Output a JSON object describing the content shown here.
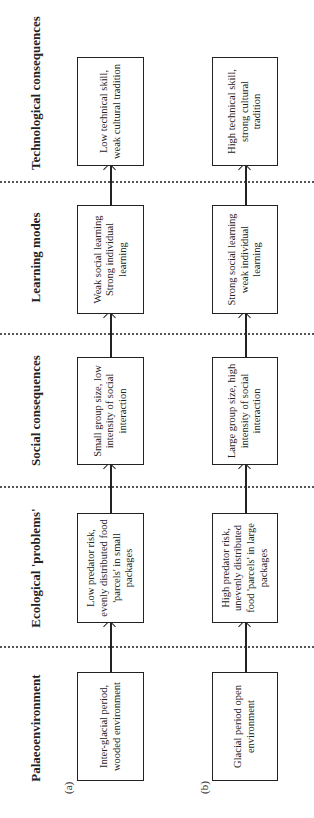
{
  "headers": [
    "Palaeoenvironment",
    "Ecological 'problems'",
    "Social consequences",
    "Learning modes",
    "Technological consequences"
  ],
  "rows": [
    {
      "label": "(a)",
      "boxes": [
        "Inter-glacial period, wooded environment",
        "Low predator risk, evenly distributed food 'parcels' in small packages",
        "Small group size, low intensity of social interaction",
        "Weak social learning Strong individual learning",
        "Low technical skill, weak cultural tradition"
      ]
    },
    {
      "label": "(b)",
      "boxes": [
        "Glacial period open environment",
        "High predator risk, unevenly distributed food 'parcels' in large packages",
        "Large group size, high intensity of social interaction",
        "Strong social learning weak individual learning",
        "High technical skill, strong cultural tradition"
      ]
    }
  ]
}
